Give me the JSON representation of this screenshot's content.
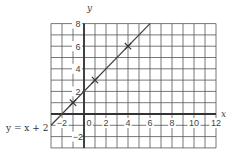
{
  "chart_data": {
    "type": "line",
    "title": "",
    "xlabel": "x",
    "ylabel": "y",
    "xlim": [
      -3,
      12
    ],
    "ylim": [
      -3,
      8
    ],
    "grid": true,
    "x_ticks": [
      -2,
      0,
      2,
      4,
      6,
      8,
      10,
      12
    ],
    "y_ticks": [
      -2,
      2,
      4,
      6,
      8
    ],
    "origin_label": "0",
    "series": [
      {
        "name": "y = x + 2",
        "equation": "y = x + 2",
        "x": [
          -3,
          6
        ],
        "y": [
          -1,
          8
        ],
        "marked_points": [
          {
            "x": -1,
            "y": 1
          },
          {
            "x": 1,
            "y": 3
          },
          {
            "x": 4,
            "y": 6
          }
        ]
      }
    ],
    "annotations": [
      {
        "text": "y = x + 2",
        "position": "left of grid, near x-axis"
      }
    ]
  },
  "labels": {
    "x_axis": "x",
    "y_axis": "y",
    "origin": "0",
    "equation": "y = x + 2"
  },
  "colors": {
    "grid": "#555555",
    "axis": "#333333",
    "line": "#444444",
    "text": "#444444"
  }
}
